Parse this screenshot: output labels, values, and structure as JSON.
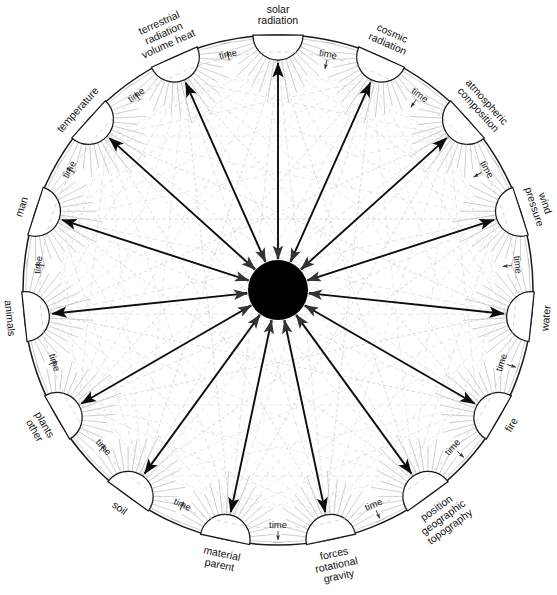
{
  "diagram": {
    "center_node": {
      "name": "central-hub",
      "fill": "#000000",
      "radius": 30
    },
    "geometry": {
      "cx": 278,
      "cy": 290,
      "r": 255,
      "node_radius": 25,
      "start_angle_deg": -90,
      "node_count": 15
    },
    "colors": {
      "ink": "#111111",
      "rim": "#1a1a1a",
      "faint_web": "#b9b9b9",
      "arrow": "#0d0d0d",
      "node_fill": "#ffffff"
    },
    "time_label": "time",
    "nodes": [
      {
        "id": "solar-radiation",
        "label": "solar radiation",
        "lines": [
          "solar",
          "radiation"
        ]
      },
      {
        "id": "cosmic-radiation",
        "label": "cosmic radiation",
        "lines": [
          "cosmic",
          "radiation"
        ]
      },
      {
        "id": "atmospheric-composition",
        "label": "atmospheric composition",
        "lines": [
          "atmospheric",
          "composition"
        ]
      },
      {
        "id": "wind-pressure",
        "label": "wind pressure",
        "lines": [
          "wind",
          "pressure"
        ]
      },
      {
        "id": "water",
        "label": "water",
        "lines": [
          "water"
        ]
      },
      {
        "id": "fire",
        "label": "fire",
        "lines": [
          "fire"
        ]
      },
      {
        "id": "topography",
        "label": "topography geographic position",
        "lines": [
          "topography",
          "geographic",
          "position"
        ]
      },
      {
        "id": "gravity",
        "label": "gravity rotational forces",
        "lines": [
          "gravity",
          "rotational",
          "forces"
        ]
      },
      {
        "id": "parent-material",
        "label": "parent material",
        "lines": [
          "parent",
          "material"
        ]
      },
      {
        "id": "soil",
        "label": "soil",
        "lines": [
          "soil"
        ]
      },
      {
        "id": "other-plants",
        "label": "other plants",
        "lines": [
          "other",
          "plants"
        ]
      },
      {
        "id": "animals",
        "label": "animals",
        "lines": [
          "animals"
        ]
      },
      {
        "id": "man",
        "label": "man",
        "lines": [
          "man"
        ]
      },
      {
        "id": "temperature",
        "label": "temperature",
        "lines": [
          "temperature"
        ]
      },
      {
        "id": "terrestrial-radiation",
        "label": "terrestrial radiation volume heat",
        "lines": [
          "terrestrial",
          "radiation",
          "volume heat"
        ]
      }
    ]
  },
  "chart_data": {
    "type": "diagram",
    "categories": [
      "solar radiation",
      "cosmic radiation",
      "atmospheric composition",
      "wind pressure",
      "water",
      "fire",
      "topography geographic position",
      "gravity rotational forces",
      "parent material",
      "soil",
      "other plants",
      "animals",
      "man",
      "temperature",
      "terrestrial radiation volume heat"
    ],
    "hub_edges_direction": "outward",
    "rim_annotation": "time",
    "rim_annotation_count": 15,
    "mesh": "all-pairs faint chords between perimeter nodes"
  }
}
